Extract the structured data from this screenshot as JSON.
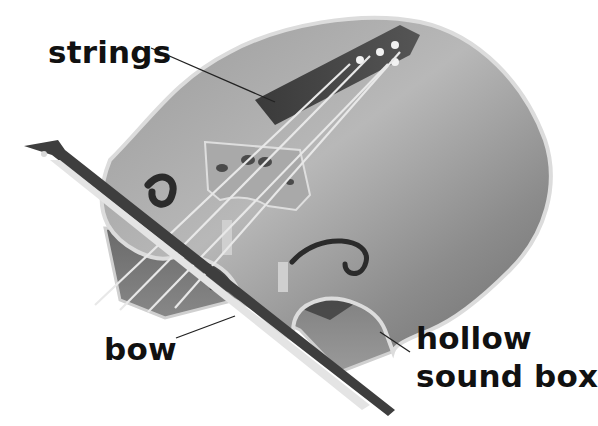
{
  "diagram": {
    "labels": {
      "strings": "strings",
      "bow": "bow",
      "sound_box_line1": "hollow",
      "sound_box_line2": "sound box"
    },
    "colors": {
      "background": "#ffffff",
      "body_light": "#bdbdbd",
      "body_mid": "#8f8f8f",
      "body_dark": "#4a4a4a",
      "edge": "#d9d9d9",
      "label_text": "#111111",
      "leader_line": "#222222"
    }
  }
}
